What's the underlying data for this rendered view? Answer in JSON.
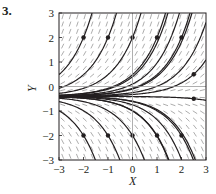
{
  "problem_number": "3.",
  "chart_data": {
    "type": "line",
    "title": "",
    "subtitle": "Slope (direction) field with solution curves",
    "xlabel": "X",
    "ylabel": "Y",
    "xlim": [
      -3,
      3
    ],
    "ylim": [
      -3,
      3
    ],
    "xticks": [
      "-3",
      "-2",
      "-1",
      "0",
      "1",
      "2",
      "3"
    ],
    "yticks": [
      "-3",
      "-2",
      "-1",
      "0",
      "1",
      "2",
      "3"
    ],
    "grid": "light lines at x=0 and y=0",
    "legend": "none",
    "initial_points": [
      {
        "x": -2,
        "y": 2
      },
      {
        "x": -1,
        "y": 2
      },
      {
        "x": 0,
        "y": 2
      },
      {
        "x": 1,
        "y": 2
      },
      {
        "x": 2,
        "y": 2
      },
      {
        "x": 2.5,
        "y": 0.5
      },
      {
        "x": 2.5,
        "y": -0.5
      },
      {
        "x": -2,
        "y": -2
      },
      {
        "x": -1,
        "y": -2
      },
      {
        "x": 0,
        "y": -2
      },
      {
        "x": 1,
        "y": -2
      },
      {
        "x": 2,
        "y": -2
      }
    ],
    "curve_model": "approx y = -0.4 + (y0 + 0.4)·e^(x - x0), converging toward y≈-0.4 as x→-3 and fanning out for increasing x"
  },
  "colors": {
    "ink": "#231f20",
    "field": "#8a8a8a",
    "axis_line": "#9a9a9a"
  }
}
